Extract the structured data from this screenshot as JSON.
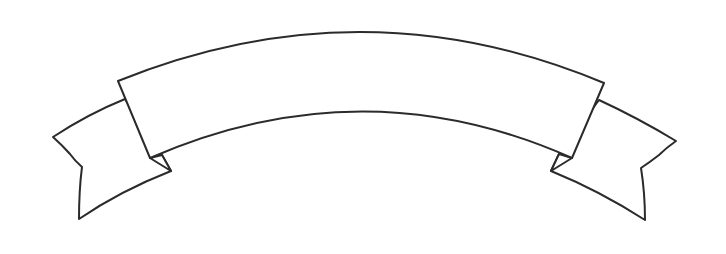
{
  "illustration": {
    "type": "ribbon-banner",
    "text": "",
    "colors": {
      "background": "#ffffff",
      "stroke": "#2b2b2b",
      "fill": "#ffffff"
    }
  }
}
